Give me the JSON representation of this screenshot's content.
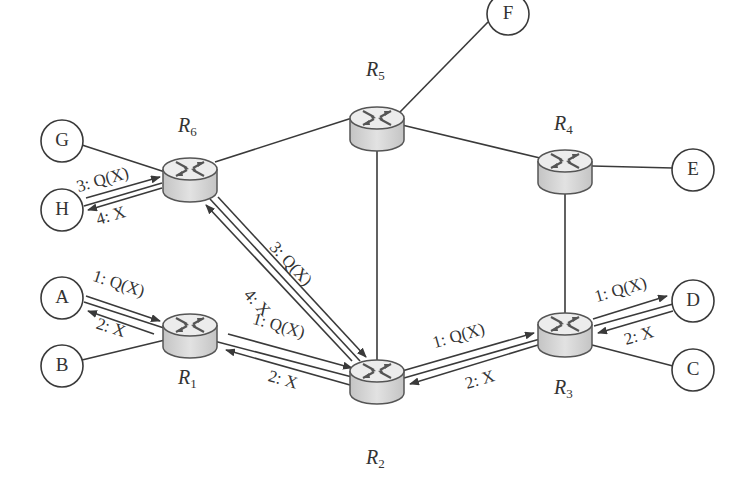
{
  "diagram": {
    "type": "network-query-flow",
    "routers": [
      {
        "id": "R1",
        "label": "R",
        "sub": "1",
        "x": 190,
        "y": 334
      },
      {
        "id": "R2",
        "label": "R",
        "sub": "2",
        "x": 377,
        "y": 380
      },
      {
        "id": "R3",
        "label": "R",
        "sub": "3",
        "x": 565,
        "y": 333
      },
      {
        "id": "R4",
        "label": "R",
        "sub": "4",
        "x": 565,
        "y": 163
      },
      {
        "id": "R5",
        "label": "R",
        "sub": "5",
        "x": 377,
        "y": 125
      },
      {
        "id": "R6",
        "label": "R",
        "sub": "6",
        "x": 190,
        "y": 175
      }
    ],
    "hosts": [
      {
        "id": "A",
        "label": "A",
        "x": 62,
        "y": 298
      },
      {
        "id": "B",
        "label": "B",
        "x": 62,
        "y": 366
      },
      {
        "id": "C",
        "label": "C",
        "x": 693,
        "y": 370
      },
      {
        "id": "D",
        "label": "D",
        "x": 693,
        "y": 301
      },
      {
        "id": "E",
        "label": "E",
        "x": 693,
        "y": 170
      },
      {
        "id": "F",
        "label": "F",
        "x": 508,
        "y": 14
      },
      {
        "id": "G",
        "label": "G",
        "x": 62,
        "y": 141
      },
      {
        "id": "H",
        "label": "H",
        "x": 62,
        "y": 210
      }
    ],
    "links": [
      [
        "G",
        "R6"
      ],
      [
        "H",
        "R6"
      ],
      [
        "A",
        "R1"
      ],
      [
        "B",
        "R1"
      ],
      [
        "R6",
        "R5"
      ],
      [
        "R6",
        "R2"
      ],
      [
        "R1",
        "R2"
      ],
      [
        "R5",
        "R2"
      ],
      [
        "R5",
        "R4"
      ],
      [
        "R5",
        "F"
      ],
      [
        "R4",
        "E"
      ],
      [
        "R4",
        "R3"
      ],
      [
        "R2",
        "R3"
      ],
      [
        "R3",
        "D"
      ],
      [
        "R3",
        "C"
      ]
    ],
    "messages": [
      {
        "from": "A",
        "to": "R1",
        "label": "1: Q(X)"
      },
      {
        "from": "R1",
        "to": "A",
        "label": "2: X"
      },
      {
        "from": "R1",
        "to": "R2",
        "label": "1: Q(X)"
      },
      {
        "from": "R2",
        "to": "R1",
        "label": "2: X"
      },
      {
        "from": "R6",
        "to": "R2",
        "label": "3: Q(X)"
      },
      {
        "from": "R2",
        "to": "R6",
        "label": "4: X"
      },
      {
        "from": "H",
        "to": "R6",
        "label": "3: Q(X)"
      },
      {
        "from": "R6",
        "to": "H",
        "label": "4: X"
      },
      {
        "from": "R2",
        "to": "R3",
        "label": "1: Q(X)"
      },
      {
        "from": "R3",
        "to": "R2",
        "label": "2: X"
      },
      {
        "from": "R3",
        "to": "D",
        "label": "1: Q(X)"
      },
      {
        "from": "D",
        "to": "R3",
        "label": "2: X"
      }
    ]
  },
  "labels": {
    "hosts": {
      "A": "A",
      "B": "B",
      "C": "C",
      "D": "D",
      "E": "E",
      "F": "F",
      "G": "G",
      "H": "H"
    },
    "routers": {
      "r1": {
        "main": "R",
        "sub": "1"
      },
      "r2": {
        "main": "R",
        "sub": "2"
      },
      "r3": {
        "main": "R",
        "sub": "3"
      },
      "r4": {
        "main": "R",
        "sub": "4"
      },
      "r5": {
        "main": "R",
        "sub": "5"
      },
      "r6": {
        "main": "R",
        "sub": "6"
      }
    },
    "msg": {
      "a_r1_q": "1: Q(X)",
      "r1_a_x": "2: X",
      "r1_r2_q": "1: Q(X)",
      "r2_r1_x": "2: X",
      "r6_r2_q": "3: Q(X)",
      "r2_r6_x": "4: X",
      "h_r6_q": "3: Q(X)",
      "r6_h_x": "4: X",
      "r2_r3_q": "1: Q(X)",
      "r3_r2_x": "2: X",
      "r3_d_q": "1: Q(X)",
      "d_r3_x": "2: X"
    }
  },
  "colors": {
    "line": "#3a3a3a",
    "router_top": "#e6e6e6",
    "router_side": "#cfcfcf",
    "router_stroke": "#555555",
    "host_fill": "#ffffff"
  }
}
